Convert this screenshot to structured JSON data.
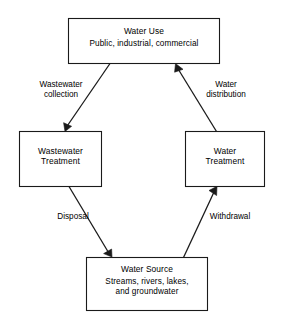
{
  "diagram": {
    "type": "flow-cycle",
    "background_color": "#ffffff",
    "line_color": "#1a1a1a",
    "text_color": "#000000",
    "nodes": [
      {
        "id": "water-use",
        "title": "Water Use",
        "subtitle": "Public, industrial, commercial"
      },
      {
        "id": "wastewater-treatment",
        "line1": "Wastewater",
        "line2": "Treatment"
      },
      {
        "id": "water-treatment",
        "line1": "Water",
        "line2": "Treatment"
      },
      {
        "id": "water-source",
        "title": "Water Source",
        "subtitle_line1": "Streams, rivers, lakes,",
        "subtitle_line2": "and groundwater"
      }
    ],
    "edges": [
      {
        "id": "wastewater-collection",
        "from": "water-use",
        "to": "wastewater-treatment",
        "label_line1": "Wastewater",
        "label_line2": "collection"
      },
      {
        "id": "disposal",
        "from": "wastewater-treatment",
        "to": "water-source",
        "label_line1": "Disposal",
        "label_line2": ""
      },
      {
        "id": "withdrawal",
        "from": "water-source",
        "to": "water-treatment",
        "label_line1": "Withdrawal",
        "label_line2": ""
      },
      {
        "id": "water-distribution",
        "from": "water-treatment",
        "to": "water-use",
        "label_line1": "Water",
        "label_line2": "distribution"
      }
    ]
  }
}
